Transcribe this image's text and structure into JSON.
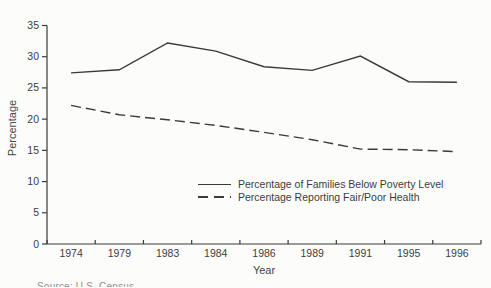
{
  "chart_data": {
    "type": "line",
    "title": "",
    "xlabel": "Year",
    "ylabel": "Percentage",
    "ylim": [
      0,
      35
    ],
    "ytick_step": 5,
    "grid": false,
    "line_color": "#3a3a3a",
    "legend_position": "inside-lower-right",
    "categories": [
      "1974",
      "1979",
      "1983",
      "1984",
      "1986",
      "1989",
      "1991",
      "1995",
      "1996"
    ],
    "series": [
      {
        "name": "Percentage of Families Below Poverty Level",
        "style": "solid",
        "values": [
          27.4,
          27.9,
          32.2,
          30.9,
          28.4,
          27.8,
          30.1,
          26.0,
          25.9
        ]
      },
      {
        "name": "Percentage Reporting Fair/Poor Health",
        "style": "dashed",
        "values": [
          22.2,
          20.7,
          19.9,
          19.0,
          17.9,
          16.7,
          15.2,
          15.1,
          14.8
        ]
      }
    ]
  },
  "caption": {
    "partial_text": "Source: U.S. Census"
  }
}
